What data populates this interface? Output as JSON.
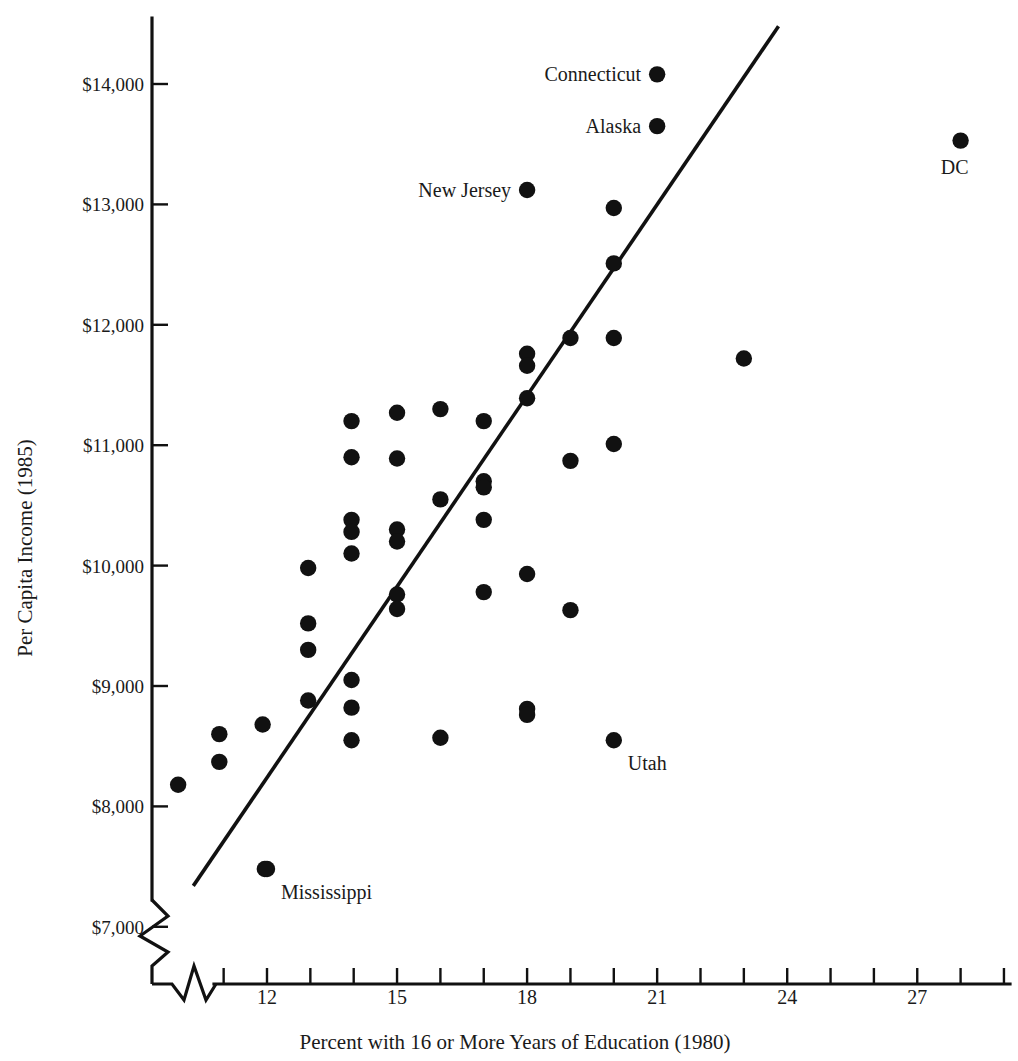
{
  "chart_data": {
    "type": "scatter",
    "title": "",
    "xlabel": "Percent with 16 or More Years of Education (1980)",
    "ylabel": "Per Capita Income (1985)",
    "xlim": [
      9.6,
      29.4
    ],
    "ylim": [
      7000,
      14500
    ],
    "grid": false,
    "legend": null,
    "axis_break_x": true,
    "axis_break_y": true,
    "xticks": [
      11,
      12,
      13,
      14,
      15,
      16,
      17,
      18,
      19,
      20,
      21,
      22,
      23,
      24,
      25,
      26,
      27,
      28,
      29
    ],
    "xtick_labels": [
      {
        "value": 12,
        "text": "12"
      },
      {
        "value": 15,
        "text": "15"
      },
      {
        "value": 18,
        "text": "18"
      },
      {
        "value": 21,
        "text": "21"
      },
      {
        "value": 24,
        "text": "24"
      },
      {
        "value": 27,
        "text": "27"
      }
    ],
    "yticks": [
      7000,
      8000,
      9000,
      10000,
      11000,
      12000,
      13000,
      14000
    ],
    "ytick_labels": [
      {
        "value": 14000,
        "text": "$14,000"
      },
      {
        "value": 13000,
        "text": "$13,000"
      },
      {
        "value": 12000,
        "text": "$12,000"
      },
      {
        "value": 11000,
        "text": "$11,000"
      },
      {
        "value": 10000,
        "text": "$10,000"
      },
      {
        "value": 9000,
        "text": "$9,000"
      },
      {
        "value": 8000,
        "text": "$8,000"
      },
      {
        "value": 7000,
        "text": "$7,000"
      }
    ],
    "points": [
      {
        "x": 9.95,
        "y": 8180
      },
      {
        "x": 10.9,
        "y": 8600
      },
      {
        "x": 10.9,
        "y": 8370
      },
      {
        "x": 11.9,
        "y": 8680
      },
      {
        "x": 11.95,
        "y": 7480
      },
      {
        "x": 12.95,
        "y": 9980
      },
      {
        "x": 12.95,
        "y": 9520
      },
      {
        "x": 12.95,
        "y": 9300
      },
      {
        "x": 12.95,
        "y": 8880
      },
      {
        "x": 13.95,
        "y": 11200
      },
      {
        "x": 13.95,
        "y": 10900
      },
      {
        "x": 13.95,
        "y": 10380
      },
      {
        "x": 13.95,
        "y": 10280
      },
      {
        "x": 13.95,
        "y": 10100
      },
      {
        "x": 13.95,
        "y": 9050
      },
      {
        "x": 13.95,
        "y": 8820
      },
      {
        "x": 13.95,
        "y": 8550
      },
      {
        "x": 15.0,
        "y": 11270
      },
      {
        "x": 15.0,
        "y": 10890
      },
      {
        "x": 15.0,
        "y": 10300
      },
      {
        "x": 15.0,
        "y": 10200
      },
      {
        "x": 15.0,
        "y": 9760
      },
      {
        "x": 15.0,
        "y": 9640
      },
      {
        "x": 16.0,
        "y": 11300
      },
      {
        "x": 16.0,
        "y": 10550
      },
      {
        "x": 16.0,
        "y": 8570
      },
      {
        "x": 17.0,
        "y": 11200
      },
      {
        "x": 17.0,
        "y": 10700
      },
      {
        "x": 17.0,
        "y": 10650
      },
      {
        "x": 17.0,
        "y": 10380
      },
      {
        "x": 17.0,
        "y": 9780
      },
      {
        "x": 18.0,
        "y": 13120,
        "label": "New Jersey",
        "label_pos": "left"
      },
      {
        "x": 18.0,
        "y": 11760
      },
      {
        "x": 18.0,
        "y": 11660
      },
      {
        "x": 18.0,
        "y": 11390
      },
      {
        "x": 18.0,
        "y": 9930
      },
      {
        "x": 18.0,
        "y": 8810
      },
      {
        "x": 18.0,
        "y": 8760
      },
      {
        "x": 19.0,
        "y": 11890
      },
      {
        "x": 19.0,
        "y": 10870
      },
      {
        "x": 19.0,
        "y": 9630
      },
      {
        "x": 20.0,
        "y": 8550,
        "label": "Utah",
        "label_pos": "below-right"
      },
      {
        "x": 20.0,
        "y": 12970
      },
      {
        "x": 20.0,
        "y": 12510
      },
      {
        "x": 20.0,
        "y": 11890
      },
      {
        "x": 20.0,
        "y": 11010
      },
      {
        "x": 21.0,
        "y": 14080,
        "label": "Connecticut",
        "label_pos": "left"
      },
      {
        "x": 21.0,
        "y": 13650,
        "label": "Alaska",
        "label_pos": "left"
      },
      {
        "x": 23.0,
        "y": 11720
      },
      {
        "x": 28.0,
        "y": 13530,
        "label": "DC",
        "label_pos": "below"
      },
      {
        "x": 12.0,
        "y": 7480,
        "label": "Mississippi",
        "label_pos": "below-right"
      }
    ],
    "fit_line": {
      "x0": 10.3,
      "y0": 7340,
      "x1": 23.8,
      "y1": 14480
    }
  },
  "labels": {
    "connecticut": "Connecticut",
    "alaska": "Alaska",
    "new_jersey": "New Jersey",
    "dc": "DC",
    "utah": "Utah",
    "mississippi": "Mississippi"
  },
  "axes": {
    "x_title": "Percent with 16 or More Years of Education (1980)",
    "y_title": "Per Capita Income (1985)"
  },
  "colors": {
    "ink": "#111111",
    "background": "#ffffff"
  }
}
